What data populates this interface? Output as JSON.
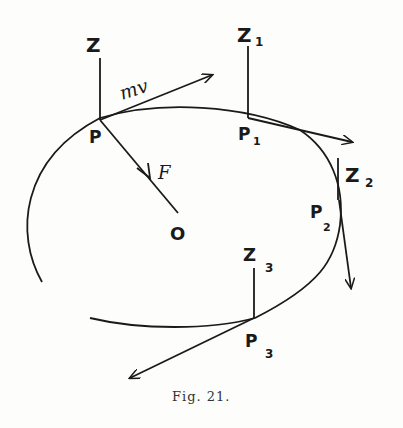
{
  "caption": "Fig. 21.",
  "labels": {
    "Z": "Z",
    "P": "P",
    "mv": "mv",
    "F": "F",
    "O": "O",
    "Z1": "Z",
    "Z1_sub": "1",
    "P1": "P",
    "P1_sub": "1",
    "Z2": "Z",
    "Z2_sub": "2",
    "P2": "P",
    "P2_sub": "2",
    "Z3": "Z",
    "Z3_sub": "3",
    "P3": "P",
    "P3_sub": "3"
  },
  "colors": {
    "ink": "#1a1a1a",
    "paper": "#fdfdfb"
  }
}
